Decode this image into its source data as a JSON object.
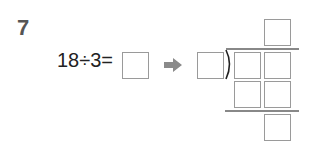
{
  "problem": {
    "number": "7",
    "equation": "18÷3=",
    "dividend": "18",
    "divisor": "3",
    "operator": "÷",
    "answer_box_value": "",
    "arrow_icon": "right-arrow-icon",
    "long_division": {
      "divisor_box_value": "",
      "quotient_box_value": "",
      "dividend_boxes": [
        "",
        ""
      ],
      "product_boxes": [
        "",
        ""
      ],
      "remainder_box_value": ""
    },
    "colors": {
      "text": "#222222",
      "number": "#555555",
      "box_border": "#9a9a9a",
      "arrow": "#8a8a8a"
    }
  }
}
